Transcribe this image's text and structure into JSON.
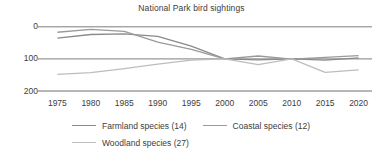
{
  "chart_data": {
    "type": "line",
    "title": "National Park bird sightings",
    "xlabel": "",
    "ylabel": "",
    "x": [
      1975,
      1980,
      1985,
      1990,
      1995,
      2000,
      2005,
      2010,
      2015,
      2020
    ],
    "xlim": [
      1973,
      2022
    ],
    "ylim": [
      0,
      215
    ],
    "yticks": [
      0,
      100,
      200
    ],
    "xticks": [
      1975,
      1980,
      1985,
      1990,
      1995,
      2000,
      2005,
      2010,
      2015,
      2020
    ],
    "grid": true,
    "grid_axis": "y",
    "legend_position": "bottom",
    "series": [
      {
        "name": "Farmland species (14)",
        "count": 14,
        "color": "#8a8a8a",
        "values": [
          165,
          176,
          178,
          170,
          140,
          100,
          97,
          100,
          96,
          103
        ]
      },
      {
        "name": "Coastal species (12)",
        "count": 12,
        "color": "#9a9a9a",
        "values": [
          183,
          192,
          186,
          152,
          130,
          100,
          109,
          99,
          105,
          110
        ]
      },
      {
        "name": "Woodland species (27)",
        "count": 27,
        "color": "#bdbdbd",
        "values": [
          52,
          57,
          70,
          84,
          96,
          100,
          82,
          100,
          58,
          66
        ]
      }
    ]
  },
  "axis": {
    "ytick_labels": [
      "200",
      "100",
      "0"
    ],
    "xtick_labels": [
      "1975",
      "1980",
      "1985",
      "1990",
      "1995",
      "2000",
      "2005",
      "2010",
      "2015",
      "2020"
    ]
  },
  "legend": {
    "rows": [
      [
        {
          "label": "Farmland species (14)",
          "color": "#8a8a8a"
        },
        {
          "label": "Coastal species (12)",
          "color": "#9a9a9a"
        }
      ],
      [
        {
          "label": "Woodland species (27)",
          "color": "#bdbdbd"
        }
      ]
    ]
  },
  "colors": {
    "text": "#3c3c3c",
    "gridline": "#6e6e6e",
    "background": "#ffffff"
  }
}
